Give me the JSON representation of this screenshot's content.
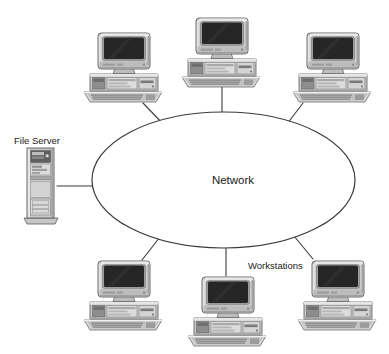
{
  "diagram": {
    "type": "star-network",
    "background_color": "#ffffff",
    "line_color": "#3a3a3a",
    "text_color": "#1a1a1a",
    "cloud": {
      "label": "Network",
      "shape": "ellipse",
      "cx": 223.5,
      "cy": 180,
      "rx": 131.5,
      "ry": 68,
      "label_x": 233,
      "label_y": 184,
      "font_size": 11.5,
      "fill": "#ffffff",
      "stroke": "#3a3a3a"
    },
    "labels": [
      {
        "name": "file-server-label",
        "text": "File Server",
        "x": 14,
        "y": 144,
        "font_size": 9.5,
        "anchor": "start"
      },
      {
        "name": "workstations-label",
        "text": "Workstations",
        "x": 248,
        "y": 269,
        "font_size": 9.5,
        "anchor": "start"
      }
    ],
    "nodes": [
      {
        "name": "file-server",
        "kind": "tower-server",
        "label": "File Server",
        "x": 24,
        "y": 148,
        "width": 34,
        "height": 78
      },
      {
        "name": "workstation-top-left",
        "kind": "workstation",
        "label": "Workstation",
        "x": 82,
        "y": 32,
        "width": 82,
        "height": 72
      },
      {
        "name": "workstation-top-center",
        "kind": "workstation",
        "label": "Workstation",
        "x": 180,
        "y": 18,
        "width": 82,
        "height": 72
      },
      {
        "name": "workstation-top-right",
        "kind": "workstation",
        "label": "Workstation",
        "x": 291,
        "y": 32,
        "width": 82,
        "height": 72
      },
      {
        "name": "workstation-bottom-left",
        "kind": "workstation",
        "label": "Workstation",
        "x": 82,
        "y": 259,
        "width": 82,
        "height": 72
      },
      {
        "name": "workstation-bottom-center",
        "kind": "workstation",
        "label": "Workstation",
        "x": 186,
        "y": 275,
        "width": 82,
        "height": 72
      },
      {
        "name": "workstation-bottom-right",
        "kind": "workstation",
        "label": "Workstation",
        "x": 296,
        "y": 259,
        "width": 82,
        "height": 72
      }
    ],
    "connections": [
      {
        "name": "link-file-server",
        "x1": 57,
        "y1": 186,
        "x2": 95,
        "y2": 186
      },
      {
        "name": "link-workstation-top-left",
        "x1": 143,
        "y1": 104,
        "x2": 163,
        "y2": 125
      },
      {
        "name": "link-workstation-top-center",
        "x1": 222,
        "y1": 88,
        "x2": 222,
        "y2": 113
      },
      {
        "name": "link-workstation-top-right",
        "x1": 303,
        "y1": 104,
        "x2": 288,
        "y2": 125
      },
      {
        "name": "link-workstation-bottom-left",
        "x1": 142,
        "y1": 259,
        "x2": 160,
        "y2": 238
      },
      {
        "name": "link-workstation-bottom-center",
        "x1": 226,
        "y1": 275,
        "x2": 226,
        "y2": 249
      },
      {
        "name": "link-workstation-bottom-right",
        "x1": 312,
        "y1": 259,
        "x2": 294,
        "y2": 237
      }
    ],
    "palette": {
      "case_light": "#d2d2d2",
      "case_mid": "#b9b9b9",
      "case_dark": "#8e8e8e",
      "case_outline": "#5a5a5a",
      "screen": "#262626",
      "screen_glare": "#3c3c3c",
      "keyboard": "#cfcfcf",
      "keyboard_keys": "#9a9a9a",
      "shadow": "#7e7e7e",
      "highlight": "#eaeaea"
    }
  }
}
